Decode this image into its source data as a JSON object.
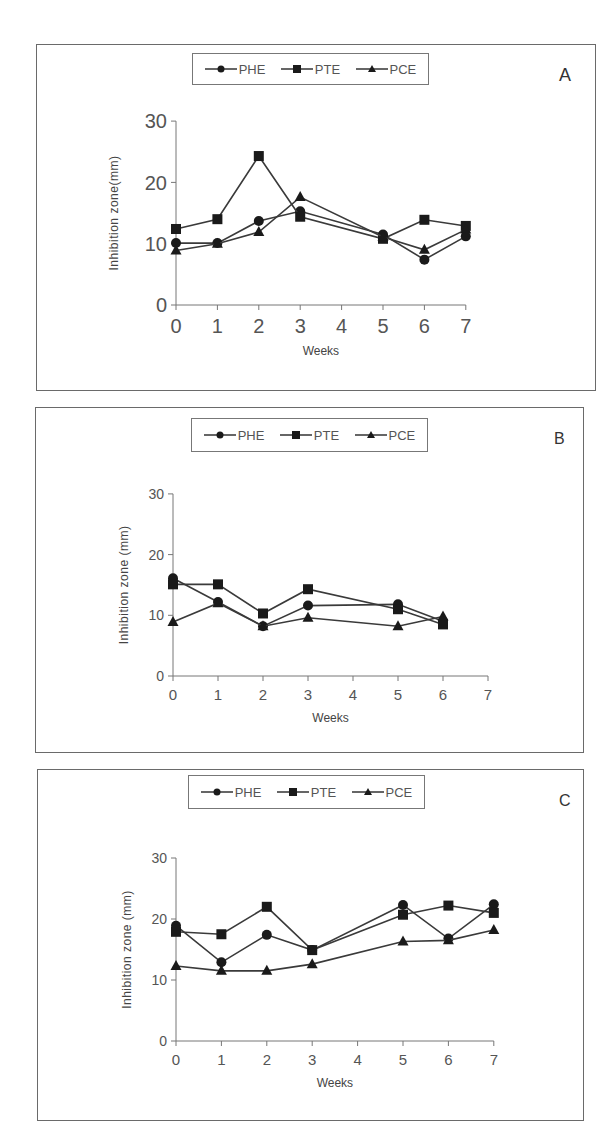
{
  "chart_data": [
    {
      "type": "line",
      "panel": "A",
      "title": "",
      "xlabel": "Weeks",
      "ylabel": "Inhibition zone(mm)",
      "x": [
        0,
        1,
        2,
        3,
        5,
        6,
        7
      ],
      "x_ticks": [
        "0",
        "1",
        "2",
        "3",
        "4",
        "5",
        "6",
        "7"
      ],
      "y_ticks": [
        "0",
        "10",
        "20",
        "30"
      ],
      "xlim": [
        0,
        7
      ],
      "ylim": [
        0,
        30
      ],
      "grid": false,
      "legend_position": "top",
      "series": [
        {
          "name": "PHE",
          "marker": "circle",
          "values": [
            10.1,
            10.1,
            13.7,
            15.3,
            11.5,
            7.4,
            11.2
          ]
        },
        {
          "name": "PTE",
          "marker": "square",
          "values": [
            12.4,
            14.0,
            24.3,
            14.4,
            10.8,
            13.9,
            12.9
          ]
        },
        {
          "name": "PCE",
          "marker": "triangle",
          "values": [
            8.9,
            10.0,
            11.9,
            17.6,
            11.1,
            9.0,
            12.3
          ]
        }
      ]
    },
    {
      "type": "line",
      "panel": "B",
      "title": "",
      "xlabel": "Weeks",
      "ylabel": "Inhibition zone (mm)",
      "x": [
        0,
        1,
        2,
        3,
        5,
        6
      ],
      "x_ticks": [
        "0",
        "1",
        "2",
        "3",
        "4",
        "5",
        "6",
        "7"
      ],
      "y_ticks": [
        "0",
        "10",
        "20",
        "30"
      ],
      "xlim": [
        0,
        7
      ],
      "ylim": [
        0,
        30
      ],
      "grid": false,
      "legend_position": "top",
      "series": [
        {
          "name": "PHE",
          "marker": "circle",
          "values": [
            16.1,
            12.2,
            8.2,
            11.6,
            11.8,
            9.0
          ]
        },
        {
          "name": "PTE",
          "marker": "square",
          "values": [
            15.1,
            15.1,
            10.3,
            14.3,
            11.0,
            8.5
          ]
        },
        {
          "name": "PCE",
          "marker": "triangle",
          "values": [
            8.9,
            12.0,
            8.2,
            9.6,
            8.2,
            9.8
          ]
        }
      ]
    },
    {
      "type": "line",
      "panel": "C",
      "title": "",
      "xlabel": "Weeks",
      "ylabel": "Inhibition zone (mm)",
      "x": [
        0,
        1,
        2,
        3,
        5,
        6,
        7
      ],
      "x_ticks": [
        "0",
        "1",
        "2",
        "3",
        "4",
        "5",
        "6",
        "7"
      ],
      "y_ticks": [
        "0",
        "10",
        "20",
        "30"
      ],
      "xlim": [
        0,
        7
      ],
      "ylim": [
        0,
        30
      ],
      "grid": false,
      "legend_position": "top",
      "series": [
        {
          "name": "PHE",
          "marker": "circle",
          "values": [
            18.9,
            12.9,
            17.4,
            14.9,
            22.3,
            16.8,
            22.4
          ]
        },
        {
          "name": "PTE",
          "marker": "square",
          "values": [
            17.9,
            17.5,
            22.0,
            14.9,
            20.7,
            22.2,
            21.0
          ]
        },
        {
          "name": "PCE",
          "marker": "triangle",
          "values": [
            12.3,
            11.5,
            11.5,
            12.6,
            16.3,
            16.5,
            18.2
          ]
        }
      ]
    }
  ],
  "panels": [
    {
      "letter": "A",
      "legend": [
        "PHE",
        "PTE",
        "PCE"
      ]
    },
    {
      "letter": "B",
      "legend": [
        "PHE",
        "PTE",
        "PCE"
      ]
    },
    {
      "letter": "C",
      "legend": [
        "PHE",
        "PTE",
        "PCE"
      ]
    }
  ],
  "colors": {
    "line": "#3a3a3a",
    "marker": "#1a1a1a",
    "axis": "#777777",
    "text": "#444444"
  }
}
